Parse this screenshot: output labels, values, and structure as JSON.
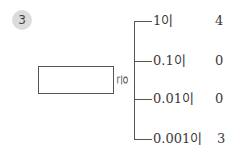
{
  "problem": {
    "number": "3",
    "answer_box_value": "",
    "particle": "은",
    "rows": [
      {
        "place": "1이",
        "digit": "4"
      },
      {
        "place": "0.1이",
        "digit": "0"
      },
      {
        "place": "0.01이",
        "digit": "0"
      },
      {
        "place": "0.001이",
        "digit": "3"
      }
    ]
  }
}
